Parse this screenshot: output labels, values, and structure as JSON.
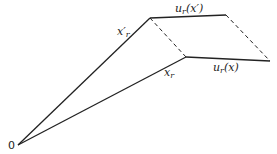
{
  "diagram": {
    "origin_label": "0",
    "labels": {
      "x_prime_r": {
        "base": "x′",
        "sub": "r"
      },
      "x_r": {
        "base": "x",
        "sub": "r"
      },
      "u_r_x_prime": {
        "pre": "u",
        "sub": "r",
        "post": "(x′)"
      },
      "u_r_x": {
        "pre": "u",
        "sub": "r",
        "post": "(x)"
      }
    },
    "points": {
      "origin": [
        18,
        145
      ],
      "x_prime_tip": [
        150,
        18
      ],
      "x_tip": [
        186,
        57
      ],
      "u_prime_end": [
        226,
        15
      ],
      "u_end": [
        270,
        61
      ]
    },
    "colors": {
      "line": "#222222",
      "background": "#ffffff"
    }
  }
}
